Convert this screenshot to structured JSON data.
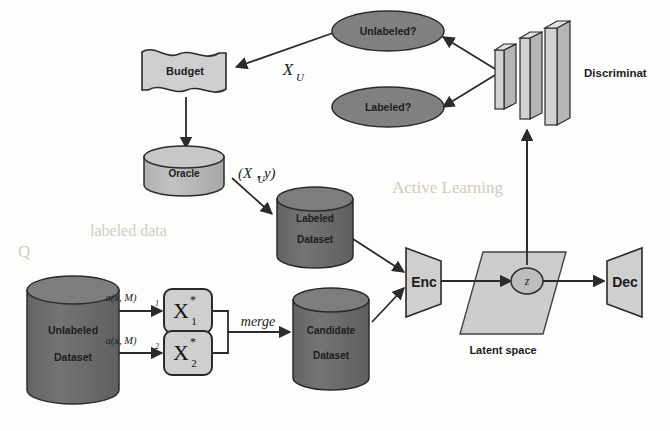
{
  "figure": {
    "type": "diagram",
    "background_color": "#fdfdfc"
  },
  "colors": {
    "dark_fill": "#6f6f6f",
    "dark_fill_top": "#7d7d7d",
    "light_fill": "#cfcfcf",
    "mid_fill": "#bdbdbd",
    "stroke": "#2b2b2b",
    "text": "#1c1c1c",
    "latent_fill": "#cbcbcb",
    "ghost": "#cfcbc4"
  },
  "nodes": {
    "budget": {
      "label": "Budget",
      "shape": "banner",
      "fill": "#cfcfcf"
    },
    "oracle": {
      "label": "Oracle",
      "shape": "cylinder",
      "fill": "#b9b9b9"
    },
    "unlabeled_dataset": {
      "line1": "Unlabeled",
      "line2": "Dataset",
      "shape": "cylinder",
      "fill": "#6f6f6f"
    },
    "labeled_dataset": {
      "line1": "Labeled",
      "line2": "Dataset",
      "shape": "cylinder",
      "fill": "#6f6f6f"
    },
    "candidate_dataset": {
      "line1": "Candidate",
      "line2": "Dataset",
      "shape": "cylinder",
      "fill": "#6f6f6f"
    },
    "x1_star": {
      "base": "X",
      "sup": "*",
      "sub": "1",
      "shape": "rounded-rect",
      "fill": "#cfcfcf"
    },
    "x2_star": {
      "base": "X",
      "sup": "*",
      "sub": "2",
      "shape": "rounded-rect",
      "fill": "#cfcfcf"
    },
    "encoder": {
      "label": "Enc",
      "shape": "trapezoid",
      "fill": "#cfcfcf"
    },
    "decoder": {
      "label": "Dec",
      "shape": "trapezoid",
      "fill": "#cfcfcf"
    },
    "latent_z": {
      "label": "z",
      "shape": "ellipse",
      "fill": "#bdbdbd"
    },
    "latent_space": {
      "label": "Latent space",
      "shape": "parallelogram",
      "fill": "#cbcbcb"
    },
    "unlabeled_question": {
      "label": "Unlabeled?",
      "shape": "ellipse",
      "fill": "#808080"
    },
    "labeled_question": {
      "label": "Labeled?",
      "shape": "ellipse",
      "fill": "#808080"
    },
    "discriminator": {
      "label": "Discriminat",
      "shape": "bars-3d",
      "fill": "#cfcfcf",
      "bar_count": 3
    }
  },
  "edge_labels": {
    "x_u": "X",
    "x_u_sub": "U",
    "oracle_out": "(X",
    "oracle_out_sub": "U",
    "oracle_out_tail": ", y)",
    "acq1": "a(x, M)",
    "acq1_sub": "1",
    "acq2": "a(x, M)",
    "acq2_sub": "2",
    "merge": "merge"
  },
  "ghost_text": [
    {
      "text": "Active Learning",
      "x": 395,
      "y": 188,
      "size": 17
    },
    {
      "text": "labeled data",
      "x": 95,
      "y": 232,
      "size": 16
    },
    {
      "text": "Q",
      "x": 20,
      "y": 252,
      "size": 17
    }
  ]
}
